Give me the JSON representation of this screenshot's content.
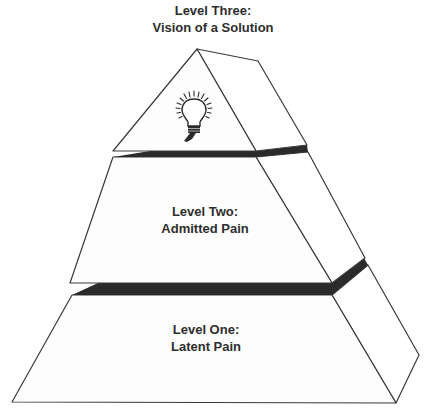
{
  "diagram": {
    "type": "three-tier pyramid",
    "title": {
      "line1": "Level Three:",
      "line2": "Vision of a Solution"
    },
    "levels": [
      {
        "id": "level-three",
        "tier": "top",
        "line1": "Level Three:",
        "line2": "Vision of a Solution",
        "icon": "lightbulb-icon"
      },
      {
        "id": "level-two",
        "tier": "middle",
        "line1": "Level Two:",
        "line2": "Admitted Pain"
      },
      {
        "id": "level-one",
        "tier": "bottom",
        "line1": "Level One:",
        "line2": "Latent Pain"
      }
    ],
    "colors": {
      "outline": "#3a3a3a",
      "face_fill": "#fdfdfd",
      "gap_fill": "#2b2b2b",
      "text": "#2e2e2e",
      "background": "#ffffff"
    }
  }
}
